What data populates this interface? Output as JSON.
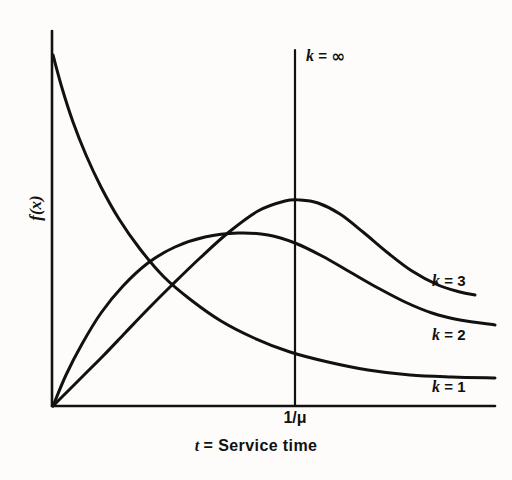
{
  "figure": {
    "background_color": "#fdfcfb",
    "line_color": "#111111",
    "width": 512,
    "height": 480
  },
  "axes": {
    "y_label": "f(x)",
    "x_title_var": "t",
    "x_title_eq": "=",
    "x_title_text": "Service time",
    "x_tick_label": "1/μ"
  },
  "curve_labels": {
    "k_inf": {
      "var": "k",
      "eq": "=",
      "value": "∞"
    },
    "k_3": {
      "var": "k",
      "eq": "=",
      "value": "3"
    },
    "k_2": {
      "var": "k",
      "eq": "=",
      "value": "2"
    },
    "k_1": {
      "var": "k",
      "eq": "=",
      "value": "1"
    }
  },
  "chart_data": {
    "type": "line",
    "title": "",
    "subtitle": "",
    "xlabel": "t = Service time",
    "ylabel": "f(x)",
    "grid": false,
    "legend_position": "inline-right-of-curve-ends",
    "annotations": [
      {
        "text": "k = ∞",
        "x_px": 306,
        "y_px": 45,
        "refers_to": "vertical line at 1/μ"
      },
      {
        "text": "k = 3",
        "x_px": 432,
        "y_px": 272
      },
      {
        "text": "k = 2",
        "x_px": 432,
        "y_px": 326
      },
      {
        "text": "k = 1",
        "x_px": 432,
        "y_px": 378
      }
    ],
    "xticks": [
      {
        "label": "1/μ",
        "x_px": 295
      }
    ],
    "yticks": [],
    "xlim_px": [
      52,
      495
    ],
    "ylim_px": [
      406,
      31
    ],
    "series": [
      {
        "name": "k = 1",
        "description": "exponential density, monotone decreasing from y-axis maximum",
        "points_px": [
          [
            53,
            55
          ],
          [
            62,
            88
          ],
          [
            73,
            122
          ],
          [
            86,
            155
          ],
          [
            101,
            187
          ],
          [
            119,
            219
          ],
          [
            140,
            249
          ],
          [
            164,
            277
          ],
          [
            191,
            300
          ],
          [
            221,
            321
          ],
          [
            254,
            338
          ],
          [
            290,
            352
          ],
          [
            328,
            362
          ],
          [
            368,
            370
          ],
          [
            410,
            375
          ],
          [
            452,
            377
          ],
          [
            495,
            378
          ]
        ]
      },
      {
        "name": "k = 2",
        "description": "Erlang-2 density, rises steeply from origin, broad flat peak before 1/μ",
        "points_px": [
          [
            53,
            406
          ],
          [
            66,
            375
          ],
          [
            82,
            344
          ],
          [
            101,
            313
          ],
          [
            123,
            286
          ],
          [
            148,
            263
          ],
          [
            175,
            247
          ],
          [
            205,
            237
          ],
          [
            238,
            233
          ],
          [
            268,
            235
          ],
          [
            295,
            243
          ],
          [
            322,
            256
          ],
          [
            350,
            272
          ],
          [
            378,
            288
          ],
          [
            405,
            302
          ],
          [
            432,
            313
          ],
          [
            460,
            320
          ],
          [
            495,
            325
          ]
        ]
      },
      {
        "name": "k = 3",
        "description": "Erlang-3 density, S-shaped rise from origin, tallest peak centered at 1/μ",
        "points_px": [
          [
            53,
            406
          ],
          [
            68,
            391
          ],
          [
            85,
            374
          ],
          [
            104,
            355
          ],
          [
            125,
            333
          ],
          [
            148,
            309
          ],
          [
            173,
            284
          ],
          [
            200,
            258
          ],
          [
            229,
            232
          ],
          [
            258,
            211
          ],
          [
            285,
            201
          ],
          [
            300,
            200
          ],
          [
            318,
            203
          ],
          [
            340,
            214
          ],
          [
            363,
            232
          ],
          [
            388,
            253
          ],
          [
            412,
            271
          ],
          [
            438,
            285
          ],
          [
            460,
            292
          ],
          [
            475,
            295
          ]
        ]
      },
      {
        "name": "k = ∞",
        "description": "degenerate (deterministic) service time: vertical spike at t = 1/μ",
        "points_px": [
          [
            295,
            406
          ],
          [
            295,
            50
          ]
        ]
      }
    ]
  }
}
